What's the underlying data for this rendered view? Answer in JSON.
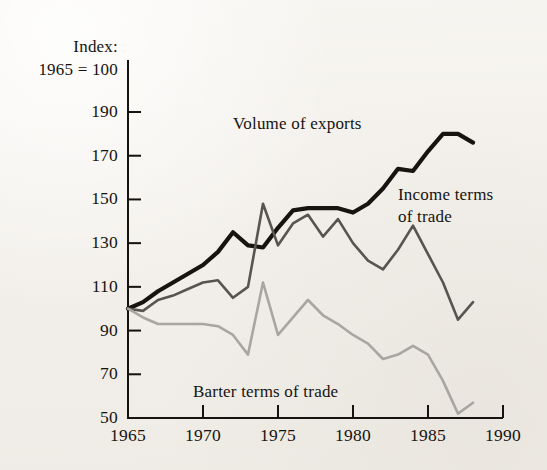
{
  "figure": {
    "background_color": "#f4f2ee",
    "ink_color": "#16130f"
  },
  "chart_data": {
    "type": "line",
    "title": "",
    "subtitle": "",
    "axis_caption": "Index:\n1965 = 100",
    "xlabel": "",
    "ylabel": "",
    "xlim": [
      1965,
      1990
    ],
    "ylim": [
      50,
      190
    ],
    "grid": false,
    "legend_position": "inline-annotations",
    "x_ticks": [
      1965,
      1970,
      1975,
      1980,
      1985,
      1990
    ],
    "x_tick_labels": [
      "1965",
      "1970",
      "1975",
      "1980",
      "1985",
      "1990"
    ],
    "y_ticks": [
      50,
      70,
      90,
      110,
      130,
      150,
      170,
      190
    ],
    "y_tick_labels": [
      "50",
      "70",
      "90",
      "110",
      "130",
      "150",
      "170",
      "190"
    ],
    "x": [
      1965,
      1966,
      1967,
      1968,
      1969,
      1970,
      1971,
      1972,
      1973,
      1974,
      1975,
      1976,
      1977,
      1978,
      1979,
      1980,
      1981,
      1982,
      1983,
      1984,
      1985,
      1986,
      1987,
      1988
    ],
    "series": [
      {
        "name": "Volume of exports",
        "color": "#17140f",
        "width": 4.2,
        "label_text": "Volume of exports",
        "values": [
          100,
          103,
          108,
          112,
          116,
          120,
          126,
          135,
          129,
          128,
          137,
          145,
          146,
          146,
          146,
          144,
          148,
          155,
          164,
          163,
          172,
          180,
          180,
          176
        ]
      },
      {
        "name": "Income terms of trade",
        "color": "#585450",
        "width": 2.6,
        "label_text": "Income terms\nof trade",
        "values": [
          100,
          99,
          104,
          106,
          109,
          112,
          113,
          105,
          110,
          148,
          129,
          139,
          143,
          133,
          141,
          130,
          122,
          118,
          127,
          138,
          125,
          112,
          95,
          103
        ]
      },
      {
        "name": "Barter terms of trade",
        "color": "#a9a6a1",
        "width": 2.6,
        "label_text": "Barter terms of trade",
        "values": [
          100,
          96,
          93,
          93,
          93,
          93,
          92,
          88,
          79,
          112,
          88,
          96,
          104,
          97,
          93,
          88,
          84,
          77,
          79,
          83,
          79,
          67,
          52,
          57
        ]
      }
    ]
  }
}
